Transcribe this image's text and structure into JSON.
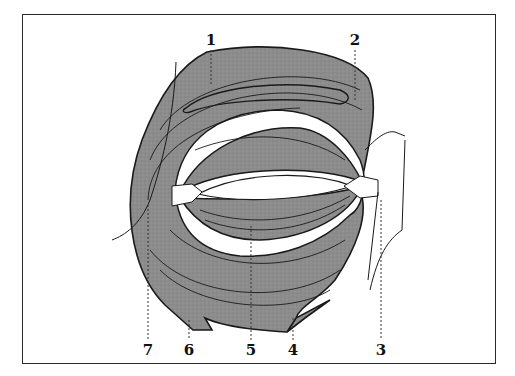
{
  "figure": {
    "muscle_fill": "#8c8c8c",
    "muscle_stroke": "#1a1a1a",
    "frame_color": "#2a2a2a",
    "background": "#ffffff"
  },
  "labels": [
    {
      "text": "1",
      "x": 211,
      "y": 33
    },
    {
      "text": "2",
      "x": 355,
      "y": 33
    },
    {
      "text": "3",
      "x": 381,
      "y": 343
    },
    {
      "text": "4",
      "x": 293,
      "y": 343
    },
    {
      "text": "5",
      "x": 251,
      "y": 343
    },
    {
      "text": "6",
      "x": 189,
      "y": 343
    },
    {
      "text": "7",
      "x": 148,
      "y": 343
    }
  ]
}
